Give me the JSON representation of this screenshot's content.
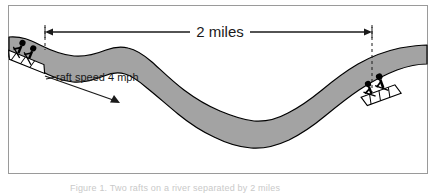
{
  "figure": {
    "frame": {
      "border_color": "#9a9a9a",
      "background_color": "#ffffff"
    },
    "river": {
      "label": "river",
      "fill_color": "#a3a3a3",
      "outline_color": "#000000",
      "flow_direction": "left-to-right-downstream"
    },
    "distance_measure": {
      "label": "2 miles",
      "value": 2,
      "unit": "miles",
      "guide_color": "#1a1a1a",
      "left_marker_x": 45,
      "right_marker_x": 372,
      "arrow_y": 32
    },
    "speed_annotation": {
      "label": "raft speed 4 mph",
      "value": 4,
      "unit": "mph",
      "arrow_color": "#1a1a1a"
    },
    "rafts": [
      {
        "name": "upstream-raft",
        "position": "left",
        "occupants": 2,
        "hull_color": "#ffffff",
        "figure_color": "#000000"
      },
      {
        "name": "downstream-raft",
        "position": "right",
        "occupants": 2,
        "hull_color": "#ffffff",
        "figure_color": "#000000"
      }
    ],
    "caption_partial": "Figure 1.  Two rafts on a river separated by 2 miles"
  }
}
